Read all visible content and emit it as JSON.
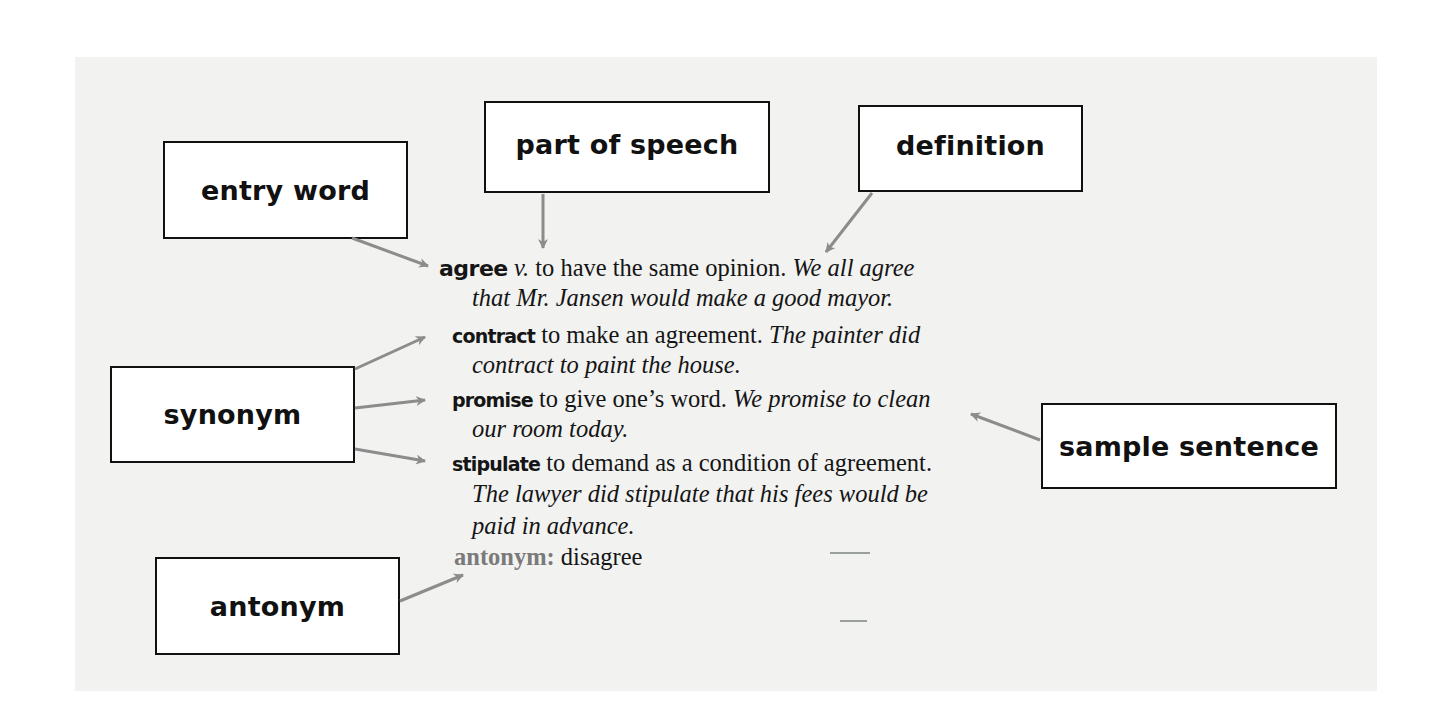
{
  "labels": {
    "entry_word": "entry word",
    "part_of_speech": "part of speech",
    "definition": "definition",
    "synonym": "synonym",
    "sample_sentence": "sample sentence",
    "antonym": "antonym"
  },
  "entry": {
    "headword": "agree",
    "pos": "v.",
    "definition": " to have the same opinion. ",
    "example_part1": "We all agree",
    "example_part2": "that Mr. Jansen would make a good mayor."
  },
  "synonyms": [
    {
      "word": "contract",
      "definition": " to make an agreement. ",
      "example_part1": "The painter did",
      "example_part2": "contract to paint the house."
    },
    {
      "word": "promise",
      "definition": " to give one’s word. ",
      "example_part1": "We promise to clean",
      "example_part2": "our room today."
    },
    {
      "word": "stipulate",
      "definition": " to demand as a condition of agreement.",
      "example_part1": "The lawyer did stipulate that his fees would be",
      "example_part2": "paid in advance."
    }
  ],
  "antonym": {
    "label": "antonym:",
    "word": " disagree"
  },
  "colors": {
    "panel_background": "#f2f2f1",
    "box_border": "#111111",
    "arrow": "#8c8c8c",
    "antonym_label": "#7a7a7a"
  }
}
